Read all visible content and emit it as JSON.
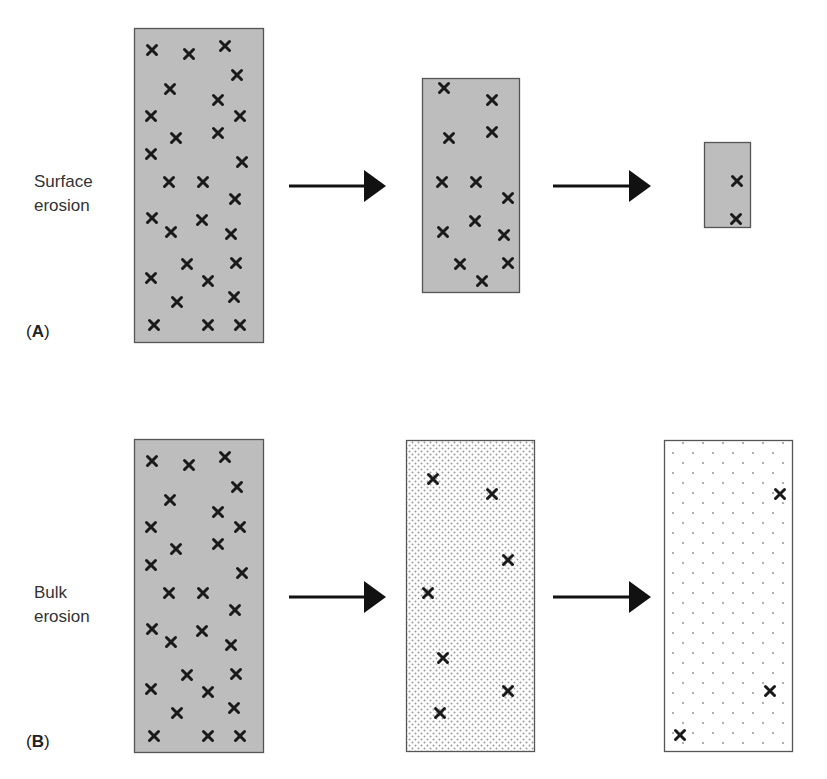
{
  "rows": [
    {
      "id": "A",
      "tag_open": "(",
      "tag_letter": "A",
      "tag_close": ")",
      "label_line1": "Surface",
      "label_line2": "erosion",
      "panels": [
        {
          "x": 134,
          "y": 28,
          "w": 129,
          "h": 314,
          "fill": "solid",
          "marks": [
            [
              152,
              50
            ],
            [
              189,
              54
            ],
            [
              225,
              46
            ],
            [
              237,
              75
            ],
            [
              170,
              89
            ],
            [
              218,
              100
            ],
            [
              151,
              116
            ],
            [
              240,
              116
            ],
            [
              176,
              138
            ],
            [
              218,
              133
            ],
            [
              151,
              154
            ],
            [
              242,
              162
            ],
            [
              169,
              182
            ],
            [
              203,
              182
            ],
            [
              235,
              199
            ],
            [
              152,
              218
            ],
            [
              171,
              232
            ],
            [
              202,
              220
            ],
            [
              231,
              234
            ],
            [
              187,
              264
            ],
            [
              236,
              263
            ],
            [
              151,
              278
            ],
            [
              208,
              281
            ],
            [
              234,
              297
            ],
            [
              177,
              302
            ],
            [
              154,
              325
            ],
            [
              208,
              325
            ],
            [
              240,
              325
            ]
          ]
        },
        {
          "x": 422,
          "y": 78,
          "w": 97,
          "h": 214,
          "fill": "solid",
          "marks": [
            [
              444,
              88
            ],
            [
              492,
              100
            ],
            [
              449,
              138
            ],
            [
              492,
              132
            ],
            [
              442,
              182
            ],
            [
              476,
              182
            ],
            [
              508,
              198
            ],
            [
              475,
              221
            ],
            [
              443,
              232
            ],
            [
              504,
              235
            ],
            [
              460,
              264
            ],
            [
              508,
              263
            ],
            [
              482,
              281
            ]
          ]
        },
        {
          "x": 704,
          "y": 142,
          "w": 46,
          "h": 85,
          "fill": "solid",
          "marks": [
            [
              737,
              181
            ],
            [
              736,
              219
            ]
          ]
        }
      ]
    },
    {
      "id": "B",
      "tag_open": "(",
      "tag_letter": "B",
      "tag_close": ")",
      "label_line1": "Bulk",
      "label_line2": "erosion",
      "panels": [
        {
          "x": 134,
          "y": 439,
          "w": 129,
          "h": 313,
          "fill": "solid",
          "marks": [
            [
              152,
              461
            ],
            [
              189,
              465
            ],
            [
              225,
              457
            ],
            [
              237,
              487
            ],
            [
              170,
              500
            ],
            [
              218,
              512
            ],
            [
              151,
              527
            ],
            [
              240,
              527
            ],
            [
              176,
              549
            ],
            [
              218,
              544
            ],
            [
              151,
              565
            ],
            [
              242,
              573
            ],
            [
              169,
              593
            ],
            [
              203,
              593
            ],
            [
              235,
              610
            ],
            [
              152,
              629
            ],
            [
              171,
              642
            ],
            [
              202,
              631
            ],
            [
              231,
              645
            ],
            [
              187,
              675
            ],
            [
              236,
              674
            ],
            [
              151,
              689
            ],
            [
              208,
              692
            ],
            [
              234,
              708
            ],
            [
              177,
              713
            ],
            [
              154,
              736
            ],
            [
              208,
              736
            ],
            [
              240,
              736
            ]
          ]
        },
        {
          "x": 406,
          "y": 440,
          "w": 128,
          "h": 311,
          "fill": "dense",
          "marks": [
            [
              433,
              479
            ],
            [
              492,
              494
            ],
            [
              508,
              560
            ],
            [
              428,
              593
            ],
            [
              443,
              658
            ],
            [
              508,
              691
            ],
            [
              440,
              713
            ]
          ]
        },
        {
          "x": 664,
          "y": 440,
          "w": 128,
          "h": 311,
          "fill": "sparse",
          "marks": [
            [
              780,
              494
            ],
            [
              770,
              691
            ],
            [
              680,
              735
            ]
          ]
        }
      ]
    }
  ],
  "arrows": [
    {
      "x1": 289,
      "x2": 386,
      "y": 186
    },
    {
      "x1": 553,
      "x2": 651,
      "y": 186
    },
    {
      "x1": 289,
      "x2": 386,
      "y": 597
    },
    {
      "x1": 553,
      "x2": 651,
      "y": 597
    }
  ],
  "colors": {
    "panel_fill": "#bdbdbd",
    "panel_border": "#555555",
    "mark": "#1a1a1a",
    "arrow": "#111111",
    "dot": "#8a8a8a"
  }
}
